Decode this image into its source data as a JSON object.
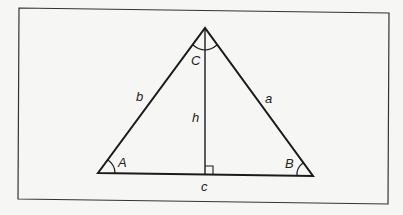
{
  "diagram": {
    "type": "triangle-with-altitude",
    "vertices": {
      "A": {
        "label": "A",
        "x": 98,
        "y": 173
      },
      "B": {
        "label": "B",
        "x": 313,
        "y": 176
      },
      "C": {
        "label": "C",
        "x": 205,
        "y": 28
      }
    },
    "sides": {
      "a": "a",
      "b": "b",
      "c": "c"
    },
    "altitude": {
      "label": "h",
      "foot_x": 205,
      "foot_y": 174
    },
    "colors": {
      "stroke": "#1a1a1a",
      "frame": "#333333",
      "background": "#f6f6f4"
    }
  }
}
